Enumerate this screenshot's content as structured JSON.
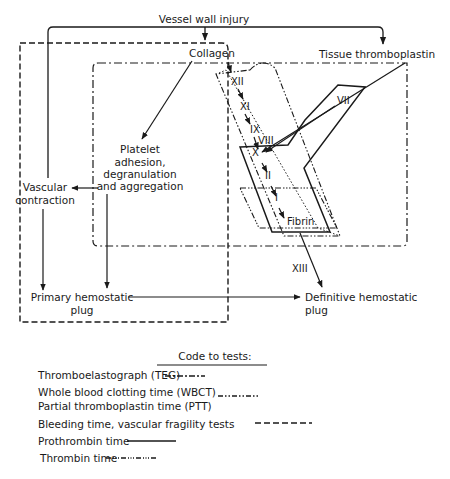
{
  "diagram": {
    "nodes": {
      "vessel_wall_injury": "Vessel wall injury",
      "collagen": "Collagen",
      "tissue_thromboplastin": "Tissue thromboplastin",
      "platelet_line1": "Platelet",
      "platelet_line2": "adhesion,",
      "platelet_line3": "degranulation",
      "platelet_line4": "and aggregation",
      "vascular_line1": "Vascular",
      "vascular_line2": "contraction",
      "primary_line1": "Primary hemostatic",
      "primary_line2": "plug",
      "definitive_line1": "Definitive hemostatic",
      "definitive_line2": "plug",
      "fibrin": "Fibrin"
    },
    "factors": {
      "xii": "XII",
      "xi": "XI",
      "ix": "IX",
      "viii": "VIII",
      "vii": "VII",
      "x": "X",
      "ii": "II",
      "i": "I",
      "xiii": "XIII"
    }
  },
  "legend": {
    "title": "Code to tests:",
    "items": [
      {
        "label": "Thromboelastograph (TEG)",
        "line_style": "dash-dot"
      },
      {
        "label": "Whole blood clotting time (WBCT)",
        "line_style": "dash-dot-dot"
      },
      {
        "label": "Partial thromboplastin time (PTT)",
        "line_style": "dash-dot-dot"
      },
      {
        "label": "Bleeding time, vascular fragility tests",
        "line_style": "dashed"
      },
      {
        "label": "Prothrombin time",
        "line_style": "solid"
      },
      {
        "label": "Thrombin time",
        "line_style": "dash-dot-dot-dot"
      }
    ]
  },
  "colors": {
    "ink": "#1a1a1a",
    "background": "#ffffff"
  }
}
